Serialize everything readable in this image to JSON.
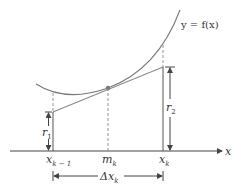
{
  "diagram": {
    "curve_label": "y = f(x)",
    "axis_label": "x",
    "points": {
      "x_prev": {
        "base": "x",
        "sub": "k − 1"
      },
      "midpoint": {
        "base": "m",
        "sub": "k"
      },
      "x_curr": {
        "base": "x",
        "sub": "k"
      }
    },
    "heights": {
      "r1": {
        "base": "r",
        "sub": "1"
      },
      "r2": {
        "base": "r",
        "sub": "2"
      }
    },
    "interval": {
      "base": "Δx",
      "sub": "k"
    },
    "colors": {
      "curve": "#7a7a7a",
      "tangent": "#8a8a8a",
      "axis": "#333333",
      "point": "#777777"
    }
  }
}
